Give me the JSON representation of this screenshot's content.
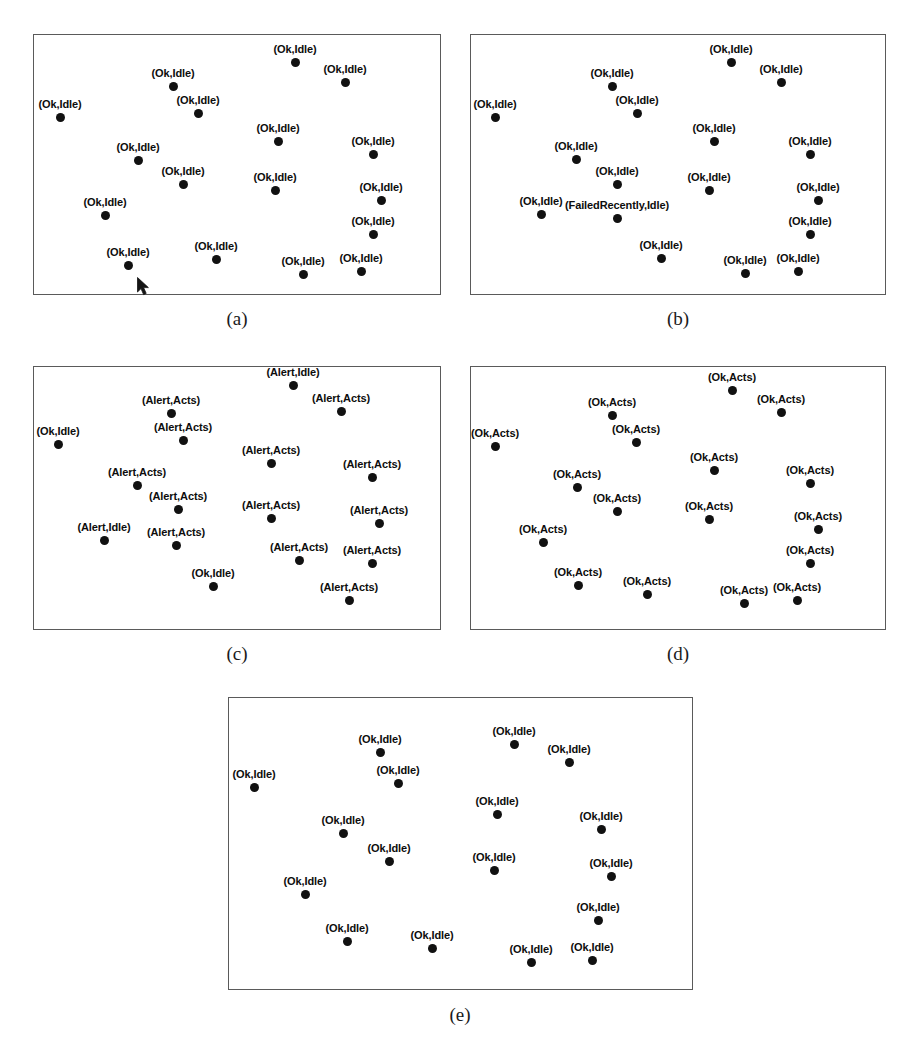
{
  "figure": {
    "background_color": "#ffffff",
    "dot_color": "#111111",
    "border_color": "#5a5a5a",
    "label_color": "#0d0d0d"
  },
  "chart_data": {
    "type": "scatter",
    "title": "",
    "xlabel": "",
    "ylabel": "",
    "grid": false,
    "legend": "none",
    "axis_ticks": "none",
    "note": "Five panels (a)-(e); each point is a node rendered as a filled black dot with a (Status,Activity) text label.",
    "panels": [
      {
        "id": "a",
        "caption": "(a)",
        "frame": {
          "x": 33,
          "y": 34,
          "w": 408,
          "h": 261
        },
        "caption_pos": {
          "x": 237,
          "y": 308
        },
        "cursor": {
          "visible": true,
          "x": 136,
          "y": 276
        },
        "points": [
          {
            "x": 60,
            "y": 117,
            "label": "(Ok,Idle)",
            "place": "above-center"
          },
          {
            "x": 173,
            "y": 86,
            "label": "(Ok,Idle)",
            "place": "above-center"
          },
          {
            "x": 198,
            "y": 113,
            "label": "(Ok,Idle)",
            "place": "above-center"
          },
          {
            "x": 138,
            "y": 160,
            "label": "(Ok,Idle)",
            "place": "above-center"
          },
          {
            "x": 183,
            "y": 184,
            "label": "(Ok,Idle)",
            "place": "above-center"
          },
          {
            "x": 105,
            "y": 215,
            "label": "(Ok,Idle)",
            "place": "above-center"
          },
          {
            "x": 128,
            "y": 265,
            "label": "(Ok,Idle)",
            "place": "above-center"
          },
          {
            "x": 216,
            "y": 259,
            "label": "(Ok,Idle)",
            "place": "above-center"
          },
          {
            "x": 295,
            "y": 62,
            "label": "(Ok,Idle)",
            "place": "above-center"
          },
          {
            "x": 345,
            "y": 82,
            "label": "(Ok,Idle)",
            "place": "above-center"
          },
          {
            "x": 278,
            "y": 141,
            "label": "(Ok,Idle)",
            "place": "above-center"
          },
          {
            "x": 275,
            "y": 190,
            "label": "(Ok,Idle)",
            "place": "above-center"
          },
          {
            "x": 303,
            "y": 274,
            "label": "(Ok,Idle)",
            "place": "above-center"
          },
          {
            "x": 373,
            "y": 154,
            "label": "(Ok,Idle)",
            "place": "above-center"
          },
          {
            "x": 381,
            "y": 200,
            "label": "(Ok,Idle)",
            "place": "above-center"
          },
          {
            "x": 373,
            "y": 234,
            "label": "(Ok,Idle)",
            "place": "above-center"
          },
          {
            "x": 361,
            "y": 271,
            "label": "(Ok,Idle)",
            "place": "above-center"
          }
        ]
      },
      {
        "id": "b",
        "caption": "(b)",
        "frame": {
          "x": 470,
          "y": 34,
          "w": 416,
          "h": 261
        },
        "caption_pos": {
          "x": 678,
          "y": 308
        },
        "cursor": {
          "visible": false,
          "x": 0,
          "y": 0
        },
        "points": [
          {
            "x": 495,
            "y": 117,
            "label": "(Ok,Idle)",
            "place": "above-center"
          },
          {
            "x": 612,
            "y": 86,
            "label": "(Ok,Idle)",
            "place": "above-center"
          },
          {
            "x": 637,
            "y": 113,
            "label": "(Ok,Idle)",
            "place": "above-center"
          },
          {
            "x": 576,
            "y": 159,
            "label": "(Ok,Idle)",
            "place": "above-center"
          },
          {
            "x": 617,
            "y": 184,
            "label": "(Ok,Idle)",
            "place": "above-center"
          },
          {
            "x": 541,
            "y": 214,
            "label": "(Ok,Idle)",
            "place": "above-center"
          },
          {
            "x": 617,
            "y": 218,
            "label": "(FailedRecently,Idle)",
            "place": "above-center"
          },
          {
            "x": 661,
            "y": 258,
            "label": "(Ok,Idle)",
            "place": "above-center"
          },
          {
            "x": 731,
            "y": 62,
            "label": "(Ok,Idle)",
            "place": "above-center"
          },
          {
            "x": 781,
            "y": 82,
            "label": "(Ok,Idle)",
            "place": "above-center"
          },
          {
            "x": 714,
            "y": 141,
            "label": "(Ok,Idle)",
            "place": "above-center"
          },
          {
            "x": 709,
            "y": 190,
            "label": "(Ok,Idle)",
            "place": "above-center"
          },
          {
            "x": 745,
            "y": 273,
            "label": "(Ok,Idle)",
            "place": "above-center"
          },
          {
            "x": 810,
            "y": 154,
            "label": "(Ok,Idle)",
            "place": "above-center"
          },
          {
            "x": 818,
            "y": 200,
            "label": "(Ok,Idle)",
            "place": "above-center"
          },
          {
            "x": 810,
            "y": 234,
            "label": "(Ok,Idle)",
            "place": "above-center"
          },
          {
            "x": 798,
            "y": 271,
            "label": "(Ok,Idle)",
            "place": "above-center"
          }
        ]
      },
      {
        "id": "c",
        "caption": "(c)",
        "frame": {
          "x": 33,
          "y": 366,
          "w": 408,
          "h": 264
        },
        "caption_pos": {
          "x": 237,
          "y": 643
        },
        "cursor": {
          "visible": false,
          "x": 0,
          "y": 0
        },
        "points": [
          {
            "x": 58,
            "y": 444,
            "label": "(Ok,Idle)",
            "place": "above-center"
          },
          {
            "x": 171,
            "y": 413,
            "label": "(Alert,Acts)",
            "place": "above-center"
          },
          {
            "x": 183,
            "y": 440,
            "label": "(Alert,Acts)",
            "place": "above-center"
          },
          {
            "x": 137,
            "y": 485,
            "label": "(Alert,Acts)",
            "place": "above-center"
          },
          {
            "x": 178,
            "y": 509,
            "label": "(Alert,Acts)",
            "place": "above-center"
          },
          {
            "x": 104,
            "y": 540,
            "label": "(Alert,Idle)",
            "place": "above-center"
          },
          {
            "x": 176,
            "y": 545,
            "label": "(Alert,Acts)",
            "place": "above-center"
          },
          {
            "x": 213,
            "y": 586,
            "label": "(Ok,Idle)",
            "place": "above-center"
          },
          {
            "x": 299,
            "y": 560,
            "label": "(Alert,Acts)",
            "place": "above-center"
          },
          {
            "x": 293,
            "y": 385,
            "label": "(Alert,Idle)",
            "place": "above-center"
          },
          {
            "x": 271,
            "y": 463,
            "label": "(Alert,Acts)",
            "place": "above-center"
          },
          {
            "x": 271,
            "y": 518,
            "label": "(Alert,Acts)",
            "place": "above-center"
          },
          {
            "x": 349,
            "y": 600,
            "label": "(Alert,Acts)",
            "place": "above-center"
          },
          {
            "x": 341,
            "y": 411,
            "label": "(Alert,Acts)",
            "place": "above-center"
          },
          {
            "x": 372,
            "y": 477,
            "label": "(Alert,Acts)",
            "place": "above-center"
          },
          {
            "x": 379,
            "y": 523,
            "label": "(Alert,Acts)",
            "place": "above-center"
          },
          {
            "x": 372,
            "y": 563,
            "label": "(Alert,Acts)",
            "place": "above-center"
          }
        ]
      },
      {
        "id": "d",
        "caption": "(d)",
        "frame": {
          "x": 470,
          "y": 366,
          "w": 416,
          "h": 264
        },
        "caption_pos": {
          "x": 678,
          "y": 643
        },
        "cursor": {
          "visible": false,
          "x": 0,
          "y": 0
        },
        "points": [
          {
            "x": 495,
            "y": 446,
            "label": "(Ok,Acts)",
            "place": "above-center"
          },
          {
            "x": 612,
            "y": 415,
            "label": "(Ok,Acts)",
            "place": "above-center"
          },
          {
            "x": 636,
            "y": 442,
            "label": "(Ok,Acts)",
            "place": "above-center"
          },
          {
            "x": 577,
            "y": 487,
            "label": "(Ok,Acts)",
            "place": "above-center"
          },
          {
            "x": 617,
            "y": 511,
            "label": "(Ok,Acts)",
            "place": "above-center"
          },
          {
            "x": 543,
            "y": 542,
            "label": "(Ok,Acts)",
            "place": "above-center"
          },
          {
            "x": 578,
            "y": 585,
            "label": "(Ok,Acts)",
            "place": "above-center"
          },
          {
            "x": 647,
            "y": 594,
            "label": "(Ok,Acts)",
            "place": "above-center"
          },
          {
            "x": 744,
            "y": 603,
            "label": "(Ok,Acts)",
            "place": "above-center"
          },
          {
            "x": 732,
            "y": 390,
            "label": "(Ok,Acts)",
            "place": "above-center"
          },
          {
            "x": 714,
            "y": 470,
            "label": "(Ok,Acts)",
            "place": "above-center"
          },
          {
            "x": 709,
            "y": 519,
            "label": "(Ok,Acts)",
            "place": "above-center"
          },
          {
            "x": 797,
            "y": 600,
            "label": "(Ok,Acts)",
            "place": "above-center"
          },
          {
            "x": 781,
            "y": 412,
            "label": "(Ok,Acts)",
            "place": "above-center"
          },
          {
            "x": 810,
            "y": 483,
            "label": "(Ok,Acts)",
            "place": "above-center"
          },
          {
            "x": 818,
            "y": 529,
            "label": "(Ok,Acts)",
            "place": "above-center"
          },
          {
            "x": 810,
            "y": 563,
            "label": "(Ok,Acts)",
            "place": "above-center"
          }
        ]
      },
      {
        "id": "e",
        "caption": "(e)",
        "frame": {
          "x": 228,
          "y": 697,
          "w": 465,
          "h": 293
        },
        "caption_pos": {
          "x": 460,
          "y": 1004
        },
        "cursor": {
          "visible": false,
          "x": 0,
          "y": 0
        },
        "points": [
          {
            "x": 254,
            "y": 787,
            "label": "(Ok,Idle)",
            "place": "above-center"
          },
          {
            "x": 380,
            "y": 752,
            "label": "(Ok,Idle)",
            "place": "above-center"
          },
          {
            "x": 398,
            "y": 783,
            "label": "(Ok,Idle)",
            "place": "above-center"
          },
          {
            "x": 343,
            "y": 833,
            "label": "(Ok,Idle)",
            "place": "above-center"
          },
          {
            "x": 389,
            "y": 861,
            "label": "(Ok,Idle)",
            "place": "above-center"
          },
          {
            "x": 305,
            "y": 894,
            "label": "(Ok,Idle)",
            "place": "above-center"
          },
          {
            "x": 347,
            "y": 941,
            "label": "(Ok,Idle)",
            "place": "above-center"
          },
          {
            "x": 432,
            "y": 948,
            "label": "(Ok,Idle)",
            "place": "above-center"
          },
          {
            "x": 531,
            "y": 962,
            "label": "(Ok,Idle)",
            "place": "above-center"
          },
          {
            "x": 514,
            "y": 744,
            "label": "(Ok,Idle)",
            "place": "above-center"
          },
          {
            "x": 497,
            "y": 814,
            "label": "(Ok,Idle)",
            "place": "above-center"
          },
          {
            "x": 494,
            "y": 870,
            "label": "(Ok,Idle)",
            "place": "above-center"
          },
          {
            "x": 592,
            "y": 960,
            "label": "(Ok,Idle)",
            "place": "above-center"
          },
          {
            "x": 569,
            "y": 762,
            "label": "(Ok,Idle)",
            "place": "above-center"
          },
          {
            "x": 601,
            "y": 829,
            "label": "(Ok,Idle)",
            "place": "above-center"
          },
          {
            "x": 611,
            "y": 876,
            "label": "(Ok,Idle)",
            "place": "above-center"
          },
          {
            "x": 598,
            "y": 920,
            "label": "(Ok,Idle)",
            "place": "above-center"
          }
        ]
      }
    ]
  }
}
